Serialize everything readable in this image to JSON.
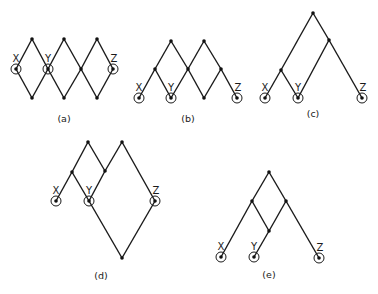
{
  "figure": {
    "colors": {
      "line": "#1a1a1a",
      "background": "#ffffff"
    },
    "panels": [
      {
        "id": "a",
        "caption": "(a)",
        "caption_pos": [
          64,
          122
        ],
        "nodes": [
          {
            "x": 32,
            "y": 39
          },
          {
            "x": 64,
            "y": 39
          },
          {
            "x": 97,
            "y": 39
          },
          {
            "x": 16,
            "y": 69,
            "label": "X",
            "circled": true
          },
          {
            "x": 48,
            "y": 69,
            "label": "Y",
            "circled": true
          },
          {
            "x": 81,
            "y": 69
          },
          {
            "x": 113,
            "y": 69,
            "label": "Z",
            "circled": true
          },
          {
            "x": 32,
            "y": 98
          },
          {
            "x": 64,
            "y": 98
          },
          {
            "x": 97,
            "y": 98
          }
        ],
        "edges": [
          [
            0,
            3
          ],
          [
            0,
            4
          ],
          [
            1,
            4
          ],
          [
            1,
            5
          ],
          [
            2,
            5
          ],
          [
            2,
            6
          ],
          [
            3,
            7
          ],
          [
            4,
            7
          ],
          [
            4,
            8
          ],
          [
            5,
            8
          ],
          [
            5,
            9
          ],
          [
            6,
            9
          ]
        ]
      },
      {
        "id": "b",
        "caption": "(b)",
        "caption_pos": [
          188,
          122
        ],
        "nodes": [
          {
            "x": 171,
            "y": 41
          },
          {
            "x": 204,
            "y": 41
          },
          {
            "x": 155,
            "y": 69
          },
          {
            "x": 188,
            "y": 69
          },
          {
            "x": 221,
            "y": 69
          },
          {
            "x": 139,
            "y": 98,
            "label": "X",
            "circled": true
          },
          {
            "x": 171,
            "y": 98,
            "label": "Y",
            "circled": true
          },
          {
            "x": 204,
            "y": 98
          },
          {
            "x": 237,
            "y": 98,
            "label": "Z",
            "circled": true
          }
        ],
        "edges": [
          [
            0,
            2
          ],
          [
            0,
            3
          ],
          [
            1,
            3
          ],
          [
            1,
            4
          ],
          [
            2,
            5
          ],
          [
            2,
            6
          ],
          [
            3,
            6
          ],
          [
            3,
            7
          ],
          [
            4,
            7
          ],
          [
            4,
            8
          ]
        ]
      },
      {
        "id": "c",
        "caption": "(c)",
        "caption_pos": [
          313,
          117
        ],
        "nodes": [
          {
            "x": 313,
            "y": 13
          },
          {
            "x": 329,
            "y": 40
          },
          {
            "x": 281,
            "y": 70
          },
          {
            "x": 265,
            "y": 98,
            "label": "X",
            "circled": true
          },
          {
            "x": 298,
            "y": 98,
            "label": "Y",
            "circled": true
          },
          {
            "x": 362,
            "y": 98,
            "label": "Z",
            "circled": true
          }
        ],
        "edges": [
          [
            0,
            2
          ],
          [
            0,
            1
          ],
          [
            1,
            4
          ],
          [
            1,
            5
          ],
          [
            2,
            3
          ],
          [
            2,
            4
          ]
        ]
      },
      {
        "id": "d",
        "caption": "(d)",
        "caption_pos": [
          101,
          279
        ],
        "nodes": [
          {
            "x": 88,
            "y": 142
          },
          {
            "x": 122,
            "y": 142
          },
          {
            "x": 72,
            "y": 172
          },
          {
            "x": 105,
            "y": 171
          },
          {
            "x": 56,
            "y": 201,
            "label": "X",
            "circled": true
          },
          {
            "x": 89,
            "y": 201,
            "label": "Y",
            "circled": true
          },
          {
            "x": 155,
            "y": 201,
            "label": "Z",
            "circled": true
          },
          {
            "x": 122,
            "y": 258
          }
        ],
        "edges": [
          [
            0,
            2
          ],
          [
            0,
            3
          ],
          [
            1,
            3
          ],
          [
            1,
            6
          ],
          [
            2,
            4
          ],
          [
            2,
            5
          ],
          [
            3,
            5
          ],
          [
            5,
            7
          ],
          [
            6,
            7
          ]
        ]
      },
      {
        "id": "e",
        "caption": "(e)",
        "caption_pos": [
          269,
          278
        ],
        "nodes": [
          {
            "x": 269,
            "y": 172
          },
          {
            "x": 252,
            "y": 201
          },
          {
            "x": 286,
            "y": 201
          },
          {
            "x": 269,
            "y": 231
          },
          {
            "x": 221,
            "y": 257,
            "label": "X",
            "circled": true
          },
          {
            "x": 254,
            "y": 257,
            "label": "Y",
            "circled": true
          },
          {
            "x": 319,
            "y": 258,
            "label": "Z",
            "circled": true
          }
        ],
        "edges": [
          [
            0,
            1
          ],
          [
            0,
            2
          ],
          [
            1,
            4
          ],
          [
            1,
            3
          ],
          [
            2,
            3
          ],
          [
            2,
            6
          ],
          [
            3,
            5
          ]
        ]
      }
    ]
  }
}
